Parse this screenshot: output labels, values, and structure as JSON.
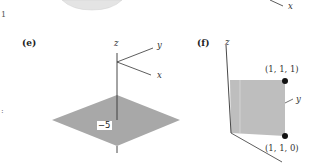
{
  "figure": {
    "top_fragment": {
      "sphere_fill": "#e6e6e6",
      "axis_label_x": "x",
      "left_margin_mark": "1"
    },
    "panels": [
      {
        "id": "e",
        "label": "(e)",
        "axes": {
          "z": "z",
          "y": "y",
          "x": "x"
        },
        "plane": {
          "type": "horizontal",
          "z_value": "−5",
          "fill": "#aaaaaa"
        }
      },
      {
        "id": "f",
        "label": "(f)",
        "axes": {
          "z": "z",
          "y": "y"
        },
        "plane": {
          "type": "vertical",
          "fill": "#bdbdbd"
        },
        "points": [
          {
            "label": "(1, 1, 1)"
          },
          {
            "label": "(1, 1, 0)"
          }
        ]
      }
    ],
    "left_margin_fragment": {
      "mark": ":"
    }
  }
}
